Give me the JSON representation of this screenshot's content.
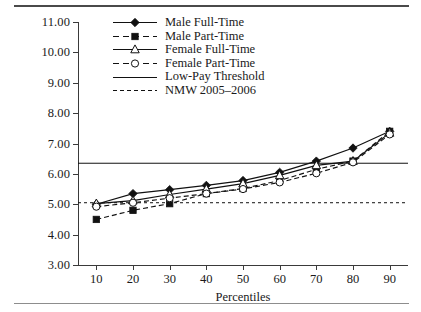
{
  "figure": {
    "ylabel": "Gross Hourly Earnings (Pounds)",
    "xlabel": "Percentiles"
  },
  "chart_data": {
    "type": "line",
    "title": "",
    "xlabel": "Percentiles",
    "ylabel": "Gross Hourly Earnings (Pounds)",
    "x": [
      10,
      20,
      30,
      40,
      50,
      60,
      70,
      80,
      90
    ],
    "xlim": [
      5,
      95
    ],
    "ylim": [
      3.0,
      11.0
    ],
    "xticks": [
      10,
      20,
      30,
      40,
      50,
      60,
      70,
      80,
      90
    ],
    "xtick_labels": [
      "10",
      "20",
      "30",
      "40",
      "50",
      "60",
      "70",
      "80",
      "90"
    ],
    "yticks": [
      3.0,
      4.0,
      5.0,
      6.0,
      7.0,
      8.0,
      9.0,
      10.0,
      11.0
    ],
    "ytick_labels": [
      "3.00",
      "4.00",
      "5.00",
      "6.00",
      "7.00",
      "8.00",
      "9.00",
      "10.00",
      "11.00"
    ],
    "grid": false,
    "legend_position": "upper-left-inside",
    "series": [
      {
        "name": "Male Full-Time",
        "marker": "filled-diamond",
        "line": "solid",
        "values": [
          5.0,
          5.35,
          5.48,
          5.62,
          5.78,
          6.05,
          6.42,
          6.85,
          7.4
        ]
      },
      {
        "name": "Male Part-Time",
        "marker": "filled-square",
        "line": "dashed",
        "values": [
          4.5,
          4.8,
          5.02,
          5.35,
          5.52,
          5.78,
          6.15,
          6.42,
          7.4
        ]
      },
      {
        "name": "Female Full-Time",
        "marker": "open-triangle",
        "line": "solid",
        "values": [
          5.02,
          5.12,
          5.32,
          5.5,
          5.68,
          5.95,
          6.28,
          6.42,
          7.35
        ]
      },
      {
        "name": "Female Part-Time",
        "marker": "open-circle",
        "line": "dashed",
        "values": [
          4.92,
          5.05,
          5.2,
          5.35,
          5.5,
          5.72,
          6.02,
          6.38,
          7.3
        ]
      },
      {
        "name": "Low-Pay Threshold",
        "marker": "none",
        "line": "solid",
        "constant": 6.35,
        "values": [
          6.35,
          6.35,
          6.35,
          6.35,
          6.35,
          6.35,
          6.35,
          6.35,
          6.35
        ]
      },
      {
        "name": "NMW 2005–2006",
        "marker": "none",
        "line": "dotted",
        "constant": 5.05,
        "values": [
          5.05,
          5.05,
          5.05,
          5.05,
          5.05,
          5.05,
          5.05,
          5.05,
          5.05
        ]
      }
    ]
  },
  "legend": {
    "items": [
      {
        "label": "Male Full-Time"
      },
      {
        "label": "Male Part-Time"
      },
      {
        "label": "Female Full-Time"
      },
      {
        "label": "Female Part-Time"
      },
      {
        "label": "Low-Pay Threshold"
      },
      {
        "label": "NMW 2005–2006"
      }
    ]
  }
}
